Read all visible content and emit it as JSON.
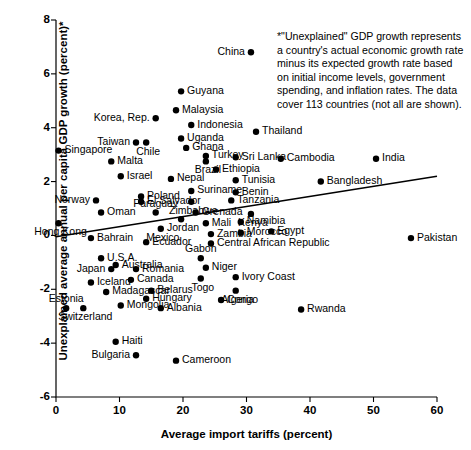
{
  "chart_data": {
    "type": "scatter",
    "title": "",
    "xlabel": "Average import tariffs (percent)",
    "ylabel": "Unexplained average annual per capita GDP growth (percent)*",
    "xlim": [
      0,
      60
    ],
    "ylim": [
      -6,
      8
    ],
    "xticks": [
      "0",
      "10",
      "20",
      "30",
      "40",
      "50",
      "60"
    ],
    "yticks": [
      "8",
      "6",
      "4",
      "2",
      "0",
      "-2",
      "-4",
      "-6"
    ],
    "grid": false,
    "legend": "none",
    "footnote": "*\"Unexplained\" GDP growth represents a country's actual economic growth rate minus its expected growth rate based on initial income levels, government spending, and inflation rates. The data cover 113 countries (not all are shown).",
    "trendline": {
      "x0": 0,
      "y0": -0.05,
      "x1": 60,
      "y1": 2.2
    },
    "points": [
      {
        "label": "China",
        "x": 30.7,
        "y": 6.8,
        "side": "left"
      },
      {
        "label": "Guyana",
        "x": 19.7,
        "y": 5.35,
        "side": "right"
      },
      {
        "label": "Malaysia",
        "x": 18.9,
        "y": 4.65,
        "side": "right"
      },
      {
        "label": "Korea, Rep.",
        "x": 15.7,
        "y": 4.35,
        "side": "left"
      },
      {
        "label": "Indonesia",
        "x": 21.3,
        "y": 4.1,
        "side": "right"
      },
      {
        "label": "Uganda",
        "x": 19.7,
        "y": 3.6,
        "side": "right"
      },
      {
        "label": "Taiwan",
        "x": 12.6,
        "y": 3.45,
        "side": "left"
      },
      {
        "label": "Chile",
        "x": 14.2,
        "y": 3.45,
        "side": "below"
      },
      {
        "label": "Ghana",
        "x": 20.5,
        "y": 3.25,
        "side": "right"
      },
      {
        "label": "Singapore",
        "x": 0.4,
        "y": 3.15,
        "side": "right"
      },
      {
        "label": "Turkey",
        "x": 23.6,
        "y": 2.95,
        "side": "right"
      },
      {
        "label": "Sri Lanka",
        "x": 28.3,
        "y": 2.9,
        "side": "right"
      },
      {
        "label": "Cambodia",
        "x": 35.4,
        "y": 2.85,
        "side": "right"
      },
      {
        "label": "India",
        "x": 50.4,
        "y": 2.85,
        "side": "right"
      },
      {
        "label": "Malta",
        "x": 8.7,
        "y": 2.75,
        "side": "right"
      },
      {
        "label": "Brazil",
        "x": 23.6,
        "y": 2.75,
        "side": "below"
      },
      {
        "label": "Ethiopia",
        "x": 25.2,
        "y": 2.45,
        "side": "right"
      },
      {
        "label": "Israel",
        "x": 10.2,
        "y": 2.2,
        "side": "right"
      },
      {
        "label": "Nepal",
        "x": 18.1,
        "y": 2.1,
        "side": "right"
      },
      {
        "label": "Tunisia",
        "x": 28.3,
        "y": 2.05,
        "side": "right"
      },
      {
        "label": "Bangladesh",
        "x": 41.7,
        "y": 2.0,
        "side": "right"
      },
      {
        "label": "Suriname",
        "x": 21.3,
        "y": 1.65,
        "side": "right"
      },
      {
        "label": "Benin",
        "x": 28.3,
        "y": 1.6,
        "side": "right"
      },
      {
        "label": "Poland",
        "x": 13.4,
        "y": 1.45,
        "side": "right"
      },
      {
        "label": "Tanzania",
        "x": 27.6,
        "y": 1.3,
        "side": "right"
      },
      {
        "label": "Norway",
        "x": 6.3,
        "y": 1.3,
        "side": "left"
      },
      {
        "label": "El Salvador",
        "x": 13.4,
        "y": 1.25,
        "side": "right"
      },
      {
        "label": "Zimbabwe",
        "x": 21.3,
        "y": 1.25,
        "side": "below"
      },
      {
        "label": "Thailand",
        "x": 31.5,
        "y": 3.85,
        "side": "right"
      },
      {
        "label": "Oman",
        "x": 7.1,
        "y": 0.85,
        "side": "right"
      },
      {
        "label": "Paraguay",
        "x": 15.7,
        "y": 0.85,
        "side": "above"
      },
      {
        "label": "Grenada",
        "x": 22.0,
        "y": 0.85,
        "side": "right"
      },
      {
        "label": "Kenya",
        "x": 30.7,
        "y": 0.8,
        "side": "below"
      },
      {
        "label": "Jordan",
        "x": 19.7,
        "y": 0.6,
        "side": "below"
      },
      {
        "label": "Hong Kong",
        "x": 0.4,
        "y": 0.45,
        "side": "below"
      },
      {
        "label": "Namibia",
        "x": 29.1,
        "y": 0.5,
        "side": "right"
      },
      {
        "label": "Mali",
        "x": 23.6,
        "y": 0.45,
        "side": "right"
      },
      {
        "label": "Mexico",
        "x": 16.5,
        "y": 0.25,
        "side": "below"
      },
      {
        "label": "Morocco",
        "x": 29.1,
        "y": 0.1,
        "side": "right"
      },
      {
        "label": "Egypt",
        "x": 33.9,
        "y": 0.15,
        "side": "right"
      },
      {
        "label": "Bahrain",
        "x": 5.5,
        "y": -0.1,
        "side": "right"
      },
      {
        "label": "Zambia",
        "x": 24.4,
        "y": 0.05,
        "side": "right"
      },
      {
        "label": "Ecuador",
        "x": 14.2,
        "y": -0.25,
        "side": "right"
      },
      {
        "label": "Central African Republic",
        "x": 24.4,
        "y": -0.3,
        "side": "right"
      },
      {
        "label": "Pakistan",
        "x": 55.9,
        "y": -0.1,
        "side": "right"
      },
      {
        "label": "U.S.A.",
        "x": 7.1,
        "y": -0.85,
        "side": "right"
      },
      {
        "label": "Gabon",
        "x": 22.8,
        "y": -0.85,
        "side": "above"
      },
      {
        "label": "Australia",
        "x": 9.4,
        "y": -1.1,
        "side": "right"
      },
      {
        "label": "Japan",
        "x": 8.7,
        "y": -1.25,
        "side": "left"
      },
      {
        "label": "Romania",
        "x": 12.6,
        "y": -1.25,
        "side": "right"
      },
      {
        "label": "Niger",
        "x": 23.6,
        "y": -1.2,
        "side": "right"
      },
      {
        "label": "Canada",
        "x": 11.8,
        "y": -1.65,
        "side": "right"
      },
      {
        "label": "Togo",
        "x": 22.8,
        "y": -1.6,
        "side": "below"
      },
      {
        "label": "Ivory Coast",
        "x": 28.3,
        "y": -1.55,
        "side": "right"
      },
      {
        "label": "Iceland",
        "x": 5.5,
        "y": -1.75,
        "side": "right"
      },
      {
        "label": "Belarus",
        "x": 15.0,
        "y": -2.05,
        "side": "right"
      },
      {
        "label": "Algeria",
        "x": 28.3,
        "y": -2.05,
        "side": "below"
      },
      {
        "label": "Madagascar",
        "x": 7.9,
        "y": -2.1,
        "side": "right"
      },
      {
        "label": "Hungary",
        "x": 14.2,
        "y": -2.35,
        "side": "right"
      },
      {
        "label": "Congo",
        "x": 26.0,
        "y": -2.4,
        "side": "right"
      },
      {
        "label": "Estonia",
        "x": 1.6,
        "y": -2.7,
        "side": "above"
      },
      {
        "label": "Mongolia",
        "x": 10.2,
        "y": -2.6,
        "side": "right"
      },
      {
        "label": "Albania",
        "x": 16.5,
        "y": -2.7,
        "side": "right"
      },
      {
        "label": "Rwanda",
        "x": 38.6,
        "y": -2.75,
        "side": "right"
      },
      {
        "label": "Switzerland",
        "x": 4.3,
        "y": -2.7,
        "side": "below"
      },
      {
        "label": "Haiti",
        "x": 9.4,
        "y": -3.95,
        "side": "right"
      },
      {
        "label": "Bulgaria",
        "x": 12.6,
        "y": -4.45,
        "side": "left"
      },
      {
        "label": "Cameroon",
        "x": 18.9,
        "y": -4.65,
        "side": "right"
      }
    ]
  }
}
